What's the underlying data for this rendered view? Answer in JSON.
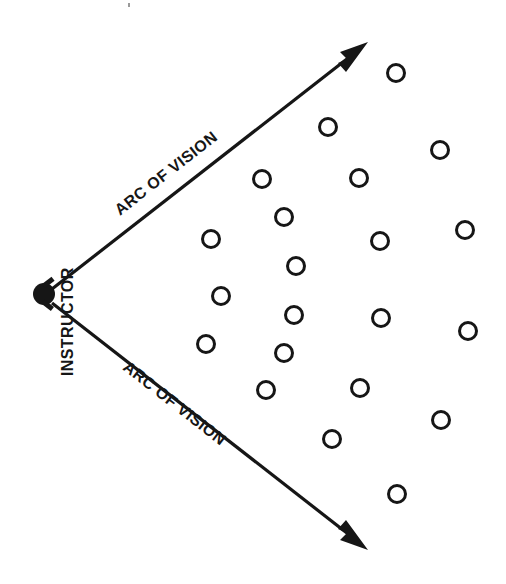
{
  "diagram": {
    "colors": {
      "ink": "#161616",
      "background": "#ffffff"
    },
    "instructor": {
      "label": "INSTRUCTOR",
      "marker": "filled-dot",
      "position": {
        "x": 44,
        "y": 294
      },
      "radius": 11,
      "label_rotation_deg": -90,
      "label_position": {
        "x": 67,
        "y": 291
      }
    },
    "arcs": [
      {
        "id": "upper",
        "label": "ARC OF VISION",
        "from": {
          "x": 52,
          "y": 289
        },
        "to": {
          "x": 366,
          "y": 44
        },
        "arrowhead": "filled-triangle",
        "label_rotation_deg": -38,
        "label_anchor": {
          "x": 188,
          "y": 160
        }
      },
      {
        "id": "lower",
        "label": "ARC OF VISION",
        "from": {
          "x": 52,
          "y": 303
        },
        "to": {
          "x": 366,
          "y": 548
        },
        "arrowhead": "filled-triangle",
        "label_rotation_deg": 38,
        "label_anchor": {
          "x": 188,
          "y": 430
        }
      }
    ],
    "students": {
      "marker": "open-circle",
      "radius": 8.5,
      "stroke_width": 3,
      "count": 21,
      "positions": [
        {
          "x": 396,
          "y": 73
        },
        {
          "x": 328,
          "y": 127
        },
        {
          "x": 440,
          "y": 150
        },
        {
          "x": 262,
          "y": 179
        },
        {
          "x": 359,
          "y": 178
        },
        {
          "x": 284,
          "y": 217
        },
        {
          "x": 465,
          "y": 230
        },
        {
          "x": 211,
          "y": 239
        },
        {
          "x": 380,
          "y": 241
        },
        {
          "x": 296,
          "y": 266
        },
        {
          "x": 221,
          "y": 296
        },
        {
          "x": 294,
          "y": 315
        },
        {
          "x": 381,
          "y": 318
        },
        {
          "x": 468,
          "y": 331
        },
        {
          "x": 206,
          "y": 344
        },
        {
          "x": 284,
          "y": 353
        },
        {
          "x": 266,
          "y": 390
        },
        {
          "x": 360,
          "y": 388
        },
        {
          "x": 441,
          "y": 420
        },
        {
          "x": 332,
          "y": 439
        },
        {
          "x": 397,
          "y": 494
        }
      ]
    },
    "artifacts": [
      {
        "id": "scan-speck",
        "x": 128,
        "y": 3,
        "w": 2,
        "h": 4
      }
    ]
  }
}
